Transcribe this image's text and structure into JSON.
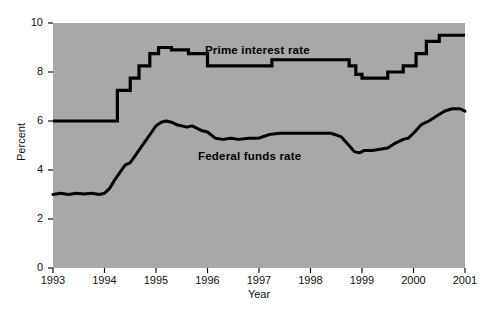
{
  "chart_data": {
    "type": "line",
    "title": "",
    "xlabel": "Year",
    "ylabel": "Percent",
    "xlim": [
      1993,
      2001
    ],
    "ylim": [
      0,
      10
    ],
    "grid": false,
    "legend_position": "inline-annotation",
    "plot_background_color": "#a8a8a8",
    "line_color": "#000000",
    "xticks": [
      "1993",
      "1994",
      "1995",
      "1996",
      "1997",
      "1998",
      "1999",
      "2000",
      "2001"
    ],
    "yticks": [
      "0",
      "2",
      "4",
      "6",
      "8",
      "10"
    ],
    "series": [
      {
        "name": "Prime interest rate",
        "color": "#000000",
        "style": "step",
        "x": [
          1993.0,
          1994.2,
          1994.25,
          1994.45,
          1994.5,
          1994.62,
          1994.67,
          1994.83,
          1994.88,
          1995.0,
          1995.05,
          1995.25,
          1995.3,
          1995.58,
          1995.63,
          1995.95,
          1996.0,
          1996.3,
          1996.35,
          1997.2,
          1997.25,
          1998.7,
          1998.75,
          1998.83,
          1998.88,
          1999.0,
          1999.45,
          1999.5,
          1999.75,
          1999.8,
          2000.0,
          2000.05,
          2000.2,
          2000.25,
          2000.45,
          2000.5,
          2001.0
        ],
        "y": [
          6.0,
          6.0,
          7.25,
          7.25,
          7.75,
          7.75,
          8.25,
          8.25,
          8.75,
          8.75,
          9.0,
          9.0,
          8.9,
          8.9,
          8.75,
          8.75,
          8.25,
          8.25,
          8.25,
          8.25,
          8.5,
          8.5,
          8.25,
          8.25,
          7.9,
          7.75,
          7.75,
          8.0,
          8.0,
          8.25,
          8.25,
          8.75,
          8.75,
          9.25,
          9.25,
          9.5,
          9.5
        ],
        "notes": "Stepped line; starts at 6.0 percent in 1993, peaks near 9.0 in mid-1995, dips to 7.75 in 1999, rises to 9.5 by mid-2000 and holds through 2001."
      },
      {
        "name": "Federal funds rate",
        "color": "#000000",
        "style": "line",
        "x": [
          1993.0,
          1993.15,
          1993.3,
          1993.45,
          1993.6,
          1993.75,
          1993.9,
          1994.0,
          1994.1,
          1994.2,
          1994.3,
          1994.4,
          1994.5,
          1994.6,
          1994.7,
          1994.8,
          1994.9,
          1995.0,
          1995.1,
          1995.2,
          1995.3,
          1995.4,
          1995.5,
          1995.6,
          1995.7,
          1995.8,
          1995.9,
          1996.0,
          1996.15,
          1996.3,
          1996.45,
          1996.6,
          1996.8,
          1997.0,
          1997.2,
          1997.4,
          1997.6,
          1997.8,
          1998.0,
          1998.2,
          1998.4,
          1998.6,
          1998.75,
          1998.85,
          1998.95,
          1999.05,
          1999.2,
          1999.35,
          1999.5,
          1999.65,
          1999.8,
          1999.9,
          2000.0,
          2000.15,
          2000.3,
          2000.45,
          2000.6,
          2000.75,
          2000.9,
          2001.0
        ],
        "y": [
          3.0,
          3.05,
          3.0,
          3.05,
          3.02,
          3.05,
          3.0,
          3.05,
          3.25,
          3.6,
          3.9,
          4.2,
          4.3,
          4.6,
          4.9,
          5.2,
          5.5,
          5.8,
          5.95,
          6.0,
          5.95,
          5.85,
          5.8,
          5.75,
          5.8,
          5.7,
          5.6,
          5.55,
          5.3,
          5.25,
          5.3,
          5.25,
          5.3,
          5.3,
          5.45,
          5.5,
          5.5,
          5.5,
          5.5,
          5.5,
          5.5,
          5.35,
          5.0,
          4.75,
          4.7,
          4.8,
          4.8,
          4.85,
          4.9,
          5.1,
          5.25,
          5.3,
          5.5,
          5.85,
          6.0,
          6.2,
          6.4,
          6.5,
          6.5,
          6.4
        ],
        "notes": "Smooth line; flat near 3.0 in 1993, climbs sharply through 1994 to a 6.0 peak in early 1995, eases to about 5.25-5.5 through 1996-1998, falls to roughly 4.75 in late 1998, then rises steadily to about 6.5 in 2000 and 6.4 at 2001."
      }
    ]
  },
  "annotations": {
    "prime_label": "Prime interest rate",
    "fedfunds_label": "Federal funds rate"
  },
  "axes": {
    "y_title": "Percent",
    "x_title": "Year"
  }
}
